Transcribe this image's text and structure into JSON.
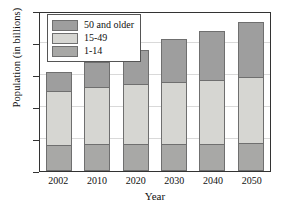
{
  "chart_data": {
    "type": "bar",
    "stacked": true,
    "title": "",
    "xlabel": "Year",
    "ylabel": "Population (in billions)",
    "categories": [
      "2002",
      "2010",
      "2020",
      "2030",
      "2040",
      "2050"
    ],
    "ylim": [
      0.0,
      5.0
    ],
    "yticks": [
      "0.0",
      "1.0",
      "2.0",
      "3.0",
      "4.0",
      "5.0"
    ],
    "ytick_values": [
      0.0,
      1.0,
      2.0,
      3.0,
      4.0,
      5.0
    ],
    "grid": true,
    "legend_position": "top-left",
    "series": [
      {
        "name": "1-14",
        "values": [
          0.82,
          0.83,
          0.84,
          0.85,
          0.85,
          0.87
        ],
        "color": "#a8a8a6"
      },
      {
        "name": "15-49",
        "values": [
          1.68,
          1.79,
          1.87,
          1.92,
          1.98,
          2.06
        ],
        "color": "#d6d6d2"
      },
      {
        "name": "50 and older",
        "values": [
          0.6,
          0.79,
          1.06,
          1.36,
          1.56,
          1.72
        ],
        "color": "#9e9e9e"
      }
    ],
    "cumulative_tops": {
      "1-14": [
        0.82,
        0.83,
        0.84,
        0.85,
        0.85,
        0.87
      ],
      "15-49": [
        2.5,
        2.62,
        2.71,
        2.77,
        2.83,
        2.93
      ],
      "50 and older": [
        3.1,
        3.41,
        3.77,
        4.13,
        4.39,
        4.65
      ]
    },
    "totals": [
      3.1,
      3.41,
      3.77,
      4.13,
      4.39,
      4.65
    ]
  },
  "legend": {
    "items": [
      {
        "label": "50 and older",
        "color": "#9e9e9e"
      },
      {
        "label": "15-49",
        "color": "#d6d6d2"
      },
      {
        "label": "1-14",
        "color": "#a8a8a6"
      }
    ]
  },
  "colors": {
    "axis": "#333333",
    "grid": "#d9d9d9",
    "bar_outline": "#6f6f6f",
    "background": "#ffffff"
  }
}
